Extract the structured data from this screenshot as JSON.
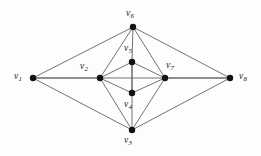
{
  "figure": {
    "type": "undirected-graph-diagram",
    "background_color": "#fdfdfd",
    "edge_color": "#5a5a5a",
    "vertex_color": "#111111",
    "label_color": "#1a1a1a"
  },
  "graph_data": {
    "type": "graph",
    "vertex_count": 8,
    "edge_count": 18,
    "vertices": [
      {
        "id": "v1",
        "base": "v",
        "sub": "1",
        "label": "v1",
        "x": 33,
        "y": 78,
        "label_x": 14,
        "label_y": 72,
        "r": 3.2
      },
      {
        "id": "v2",
        "base": "v",
        "sub": "2",
        "label": "v2",
        "x": 100,
        "y": 78,
        "label_x": 80,
        "label_y": 62,
        "r": 3.2
      },
      {
        "id": "v3",
        "base": "v",
        "sub": "3",
        "label": "v3",
        "x": 132,
        "y": 130,
        "label_x": 124,
        "label_y": 136,
        "r": 3.2
      },
      {
        "id": "v4",
        "base": "v",
        "sub": "4",
        "label": "v4",
        "x": 132,
        "y": 93,
        "label_x": 124,
        "label_y": 100,
        "r": 3.2
      },
      {
        "id": "v5",
        "base": "v",
        "sub": "5",
        "label": "v5",
        "x": 132,
        "y": 62,
        "label_x": 124,
        "label_y": 44,
        "r": 3.2
      },
      {
        "id": "v6",
        "base": "v",
        "sub": "6",
        "label": "v6",
        "x": 133,
        "y": 27,
        "label_x": 126,
        "label_y": 9,
        "r": 3.2
      },
      {
        "id": "v7",
        "base": "v",
        "sub": "7",
        "label": "v7",
        "x": 165,
        "y": 78,
        "label_x": 166,
        "label_y": 61,
        "r": 3.2
      },
      {
        "id": "v8",
        "base": "v",
        "sub": "8",
        "label": "v8",
        "x": 230,
        "y": 78,
        "label_x": 239,
        "label_y": 72,
        "r": 3.2
      }
    ],
    "edges": [
      {
        "from": "v1",
        "to": "v2",
        "weight": "strong"
      },
      {
        "from": "v1",
        "to": "v6",
        "weight": "normal"
      },
      {
        "from": "v1",
        "to": "v3",
        "weight": "normal"
      },
      {
        "from": "v2",
        "to": "v6",
        "weight": "normal"
      },
      {
        "from": "v2",
        "to": "v5",
        "weight": "normal"
      },
      {
        "from": "v2",
        "to": "v4",
        "weight": "normal"
      },
      {
        "from": "v2",
        "to": "v3",
        "weight": "normal"
      },
      {
        "from": "v2",
        "to": "v7",
        "weight": "normal"
      },
      {
        "from": "v5",
        "to": "v6",
        "weight": "normal"
      },
      {
        "from": "v5",
        "to": "v4",
        "weight": "strong"
      },
      {
        "from": "v5",
        "to": "v7",
        "weight": "normal"
      },
      {
        "from": "v4",
        "to": "v3",
        "weight": "normal"
      },
      {
        "from": "v4",
        "to": "v7",
        "weight": "normal"
      },
      {
        "from": "v6",
        "to": "v7",
        "weight": "normal"
      },
      {
        "from": "v6",
        "to": "v8",
        "weight": "normal"
      },
      {
        "from": "v3",
        "to": "v7",
        "weight": "normal"
      },
      {
        "from": "v3",
        "to": "v8",
        "weight": "normal"
      },
      {
        "from": "v7",
        "to": "v8",
        "weight": "strong"
      }
    ]
  }
}
